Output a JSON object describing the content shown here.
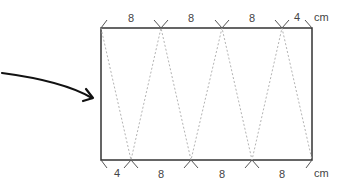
{
  "diagram": {
    "top_labels": [
      "8",
      "8",
      "8",
      "4"
    ],
    "top_unit": "cm",
    "bottom_labels": [
      "4",
      "8",
      "8",
      "8"
    ],
    "bottom_unit": "cm",
    "colors": {
      "outline": "#333333",
      "fold_line": "#aaaaaa",
      "arrow": "#111111",
      "text": "#444444"
    }
  }
}
